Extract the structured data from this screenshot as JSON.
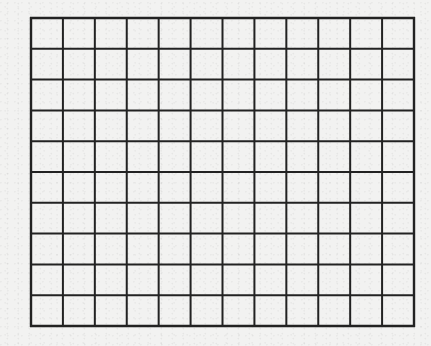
{
  "diagram": {
    "type": "grid",
    "columns": 12,
    "rows": 10,
    "line_color": "#222222",
    "background_color": "#f2f2f1",
    "cells_filled": []
  }
}
